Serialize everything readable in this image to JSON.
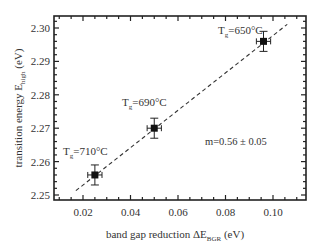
{
  "chart_data": {
    "type": "scatter",
    "title": "",
    "xlabel": "band gap reduction ΔE_BGR (eV)",
    "xlabel_main": "band gap reduction ΔE",
    "xlabel_sub": "BGR",
    "xlabel_unit": " (eV)",
    "ylabel": "transition energy E_high (eV)",
    "ylabel_main": "transition energy E",
    "ylabel_sub": "high",
    "ylabel_unit": " (eV)",
    "xlim": [
      0.01,
      0.113
    ],
    "ylim": [
      2.2485,
      2.3035
    ],
    "xticks": [
      0.02,
      0.04,
      0.06,
      0.08,
      0.1
    ],
    "xtick_labels": [
      "0.02",
      "0.04",
      "0.06",
      "0.08",
      "0.10"
    ],
    "yticks": [
      2.25,
      2.26,
      2.27,
      2.28,
      2.29,
      2.3
    ],
    "ytick_labels": [
      "2.25",
      "2.26",
      "2.27",
      "2.28",
      "2.29",
      "2.30"
    ],
    "grid": false,
    "series": [
      {
        "name": "data",
        "marker": "square",
        "points": [
          {
            "x": 0.025,
            "y": 2.256,
            "xerr": 0.003,
            "yerr": 0.003,
            "label": "T_g=710°C"
          },
          {
            "x": 0.05,
            "y": 2.27,
            "xerr": 0.003,
            "yerr": 0.003,
            "label": "T_g=690°C"
          },
          {
            "x": 0.096,
            "y": 2.296,
            "xerr": 0.003,
            "yerr": 0.003,
            "label": "T_g=650°C"
          }
        ]
      },
      {
        "name": "linear fit",
        "style": "dashed",
        "x": [
          0.017,
          0.106
        ],
        "y": [
          2.2513,
          2.3011
        ]
      }
    ],
    "annotations": [
      {
        "text": "T_g=650°C",
        "x": 0.077,
        "y": 2.2985
      },
      {
        "text": "T_g=690°C",
        "x": 0.042,
        "y": 2.2755
      },
      {
        "text": "T_g=710°C",
        "x": 0.017,
        "y": 2.2615
      },
      {
        "text": "m=0.56 ± 0.05",
        "x": 0.076,
        "y": 2.2655
      }
    ],
    "legend": null
  },
  "labels": {
    "slope": "m=0.56 ± 0.05",
    "t650_main": "T",
    "t650_sub": "g",
    "t650_rest": "=650°C",
    "t690_main": "T",
    "t690_sub": "g",
    "t690_rest": "=690°C",
    "t710_main": "T",
    "t710_sub": "g",
    "t710_rest": "=710°C"
  }
}
